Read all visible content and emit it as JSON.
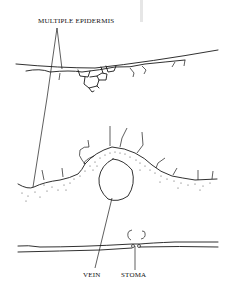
{
  "figure": {
    "type": "botanical leaf cross-section diagram",
    "labels": {
      "multiple_epidermis": "MULTIPLE EPIDERMIS",
      "vein": "VEIN",
      "stoma": "STOMA"
    },
    "colors": {
      "line": "#1a1a1a",
      "background": "#ffffff",
      "stipple": "#333333"
    }
  }
}
